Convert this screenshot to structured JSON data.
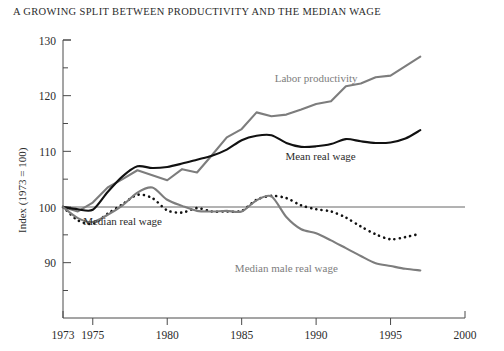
{
  "chart_data": {
    "type": "line",
    "title": "A GROWING SPLIT BETWEEN PRODUCTIVITY AND THE MEDIAN WAGE",
    "xlabel": "",
    "ylabel": "Index (1973 = 100)",
    "xlim": [
      1973,
      2000
    ],
    "ylim": [
      85,
      130
    ],
    "grid": false,
    "legend_position": "inline-annotations",
    "x_ticks": [
      1973,
      1975,
      1980,
      1985,
      1990,
      1995,
      2000
    ],
    "x_tick_labels": [
      "1973",
      "1975",
      "1980",
      "1985",
      "1990",
      "1995",
      "2000"
    ],
    "y_ticks": [
      90,
      100,
      110,
      120,
      130
    ],
    "y_tick_labels": [
      "90",
      "100",
      "110",
      "120",
      "130"
    ],
    "y_minor_ticks": [
      85,
      95,
      105,
      115,
      125
    ],
    "reference_line": 100,
    "x": [
      1973,
      1974,
      1975,
      1976,
      1977,
      1978,
      1979,
      1980,
      1981,
      1982,
      1983,
      1984,
      1985,
      1986,
      1987,
      1988,
      1989,
      1990,
      1991,
      1992,
      1993,
      1994,
      1995,
      1996,
      1997
    ],
    "series": [
      {
        "name": "Labor productivity",
        "color": "#7d7d7d",
        "style": "solid",
        "label_x": 1990.0,
        "label_y": 122.5,
        "values": [
          100.0,
          99.2,
          100.8,
          103.5,
          105.0,
          106.6,
          105.7,
          104.8,
          106.8,
          106.2,
          109.3,
          112.5,
          114.0,
          117.0,
          116.3,
          116.6,
          117.5,
          118.5,
          119.0,
          121.7,
          122.2,
          123.3,
          123.6,
          125.3,
          127.0
        ]
      },
      {
        "name": "Mean real wage",
        "color": "#111111",
        "style": "solid",
        "label_x": 1990.3,
        "label_y": 108.4,
        "values": [
          100.0,
          99.6,
          99.5,
          102.7,
          105.5,
          107.3,
          107.0,
          107.2,
          107.8,
          108.5,
          109.2,
          110.3,
          112.0,
          112.8,
          112.9,
          111.5,
          110.8,
          110.9,
          111.3,
          112.2,
          111.8,
          111.5,
          111.6,
          112.3,
          113.8
        ]
      },
      {
        "name": "Median real wage",
        "color": "#111111",
        "style": "dotted",
        "label_x": 1977.0,
        "label_y": 96.8,
        "values": [
          100.0,
          97.6,
          97.0,
          98.8,
          100.5,
          102.2,
          101.6,
          99.4,
          99.0,
          99.8,
          99.2,
          99.2,
          99.3,
          101.3,
          102.0,
          101.6,
          100.3,
          99.6,
          99.2,
          98.1,
          96.5,
          95.1,
          94.2,
          94.6,
          95.2
        ]
      },
      {
        "name": "Median male real wage",
        "color": "#7d7d7d",
        "style": "solid",
        "label_x": 1988.0,
        "label_y": 88.3,
        "values": [
          100.0,
          98.0,
          97.3,
          98.6,
          100.3,
          102.6,
          103.5,
          101.3,
          100.2,
          99.3,
          99.2,
          99.3,
          99.2,
          101.2,
          101.9,
          98.2,
          96.0,
          95.3,
          94.0,
          92.6,
          91.2,
          89.9,
          89.4,
          88.9,
          88.6
        ]
      }
    ]
  },
  "axes": {
    "y_axis_title": "Index (1973 = 100)"
  }
}
